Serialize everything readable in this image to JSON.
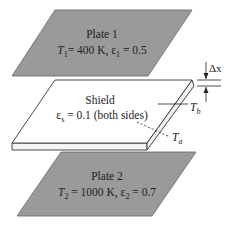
{
  "diagram": {
    "colors": {
      "plate_fill": "#9a9a9a",
      "plate_stroke": "#555555",
      "shield_fill": "#ffffff",
      "shield_edge": "#f0f0f0",
      "line": "#222222"
    },
    "plate1": {
      "name": "Plate 1",
      "temp_symbol": "T",
      "temp_sub": "1",
      "temp_value": "= 400 K, ",
      "emis_symbol": "ε",
      "emis_sub": "1",
      "emis_value": " = 0.5"
    },
    "shield": {
      "name": "Shield",
      "emis_symbol": "ε",
      "emis_sub": "s",
      "emis_value": " = 0.1 (both sides)",
      "ta_symbol": "T",
      "ta_sub": "a",
      "tb_symbol": "T",
      "tb_sub": "b"
    },
    "thickness": {
      "symbol": "Δx"
    },
    "plate2": {
      "name": "Plate 2",
      "temp_symbol": "T",
      "temp_sub": "2",
      "temp_value": " = 1000 K, ",
      "emis_symbol": "ε",
      "emis_sub": "2",
      "emis_value": " = 0.7"
    }
  }
}
